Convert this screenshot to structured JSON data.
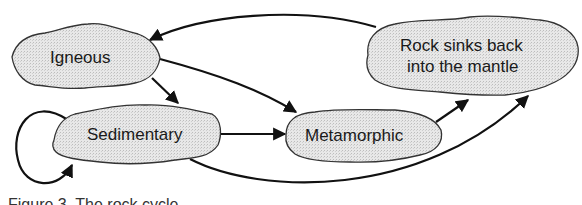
{
  "diagram": {
    "nodes": [
      {
        "id": "igneous",
        "label": "Igneous"
      },
      {
        "id": "sedimentary",
        "label": "Sedimentary"
      },
      {
        "id": "metamorphic",
        "label": "Metamorphic"
      },
      {
        "id": "mantle",
        "label_line1": "Rock sinks back",
        "label_line2": "into the mantle"
      }
    ],
    "edges": [
      {
        "from": "mantle",
        "to": "igneous"
      },
      {
        "from": "igneous",
        "to": "sedimentary"
      },
      {
        "from": "igneous",
        "to": "metamorphic"
      },
      {
        "from": "sedimentary",
        "to": "sedimentary"
      },
      {
        "from": "sedimentary",
        "to": "metamorphic"
      },
      {
        "from": "metamorphic",
        "to": "mantle"
      },
      {
        "from": "sedimentary",
        "to": "mantle"
      }
    ],
    "colors": {
      "node_fill": "#e4e4e4",
      "stroke": "#111111"
    }
  },
  "caption": "Figure 3.  The rock cycle"
}
